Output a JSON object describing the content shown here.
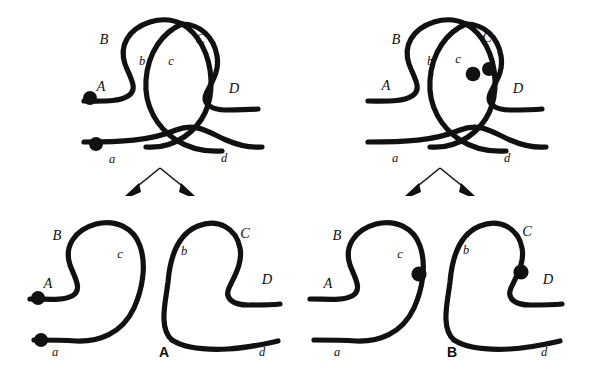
{
  "figure": {
    "kind": "recombination-intermediate-diagram",
    "background_color": "#ffffff",
    "stroke_color": "#111111",
    "panels": [
      {
        "id": "panel-A",
        "label": "A",
        "label_pos": [
          164,
          357
        ],
        "parent": {
          "id": "A-parent",
          "strand_labels": [
            {
              "text": "B",
              "x": 104,
              "y": 44,
              "case": "upper"
            },
            {
              "text": "C",
              "x": 200,
              "y": 44,
              "case": "upper"
            },
            {
              "text": "b",
              "x": 142,
              "y": 65,
              "case": "lower"
            },
            {
              "text": "c",
              "x": 171,
              "y": 65,
              "case": "lower"
            },
            {
              "text": "A",
              "x": 101,
              "y": 91,
              "case": "upper"
            },
            {
              "text": "D",
              "x": 234,
              "y": 93,
              "case": "upper"
            },
            {
              "text": "a",
              "x": 112,
              "y": 163,
              "case": "lower"
            },
            {
              "text": "d",
              "x": 224,
              "y": 162,
              "case": "lower"
            }
          ],
          "dots": [
            {
              "cx": 90,
              "cy": 98,
              "rx": 6.6,
              "ry": 7.6
            },
            {
              "cx": 96,
              "cy": 144,
              "rx": 6.4,
              "ry": 7.4
            }
          ]
        },
        "children": [
          {
            "id": "A-child-left",
            "strand_labels": [
              {
                "text": "B",
                "x": 57,
                "y": 240,
                "case": "upper"
              },
              {
                "text": "c",
                "x": 120,
                "y": 258,
                "case": "lower"
              },
              {
                "text": "A",
                "x": 48,
                "y": 288,
                "case": "upper"
              },
              {
                "text": "a",
                "x": 55,
                "y": 356,
                "case": "lower"
              }
            ],
            "dots": [
              {
                "cx": 38,
                "cy": 298,
                "rx": 6.6,
                "ry": 7.6
              },
              {
                "cx": 41,
                "cy": 340,
                "rx": 6.6,
                "ry": 7.6
              }
            ]
          },
          {
            "id": "A-child-right",
            "strand_labels": [
              {
                "text": "b",
                "x": 184,
                "y": 255,
                "case": "lower"
              },
              {
                "text": "C",
                "x": 245,
                "y": 238,
                "case": "upper"
              },
              {
                "text": "D",
                "x": 267,
                "y": 284,
                "case": "upper"
              },
              {
                "text": "d",
                "x": 262,
                "y": 356,
                "case": "lower"
              }
            ],
            "dots": []
          }
        ],
        "arrows": [
          {
            "from": [
              160,
              168
            ],
            "to": [
              131,
              192
            ]
          },
          {
            "from": [
              160,
              168
            ],
            "to": [
              189,
              192
            ]
          }
        ]
      },
      {
        "id": "panel-B",
        "label": "B",
        "label_pos": [
          452,
          357
        ],
        "parent": {
          "id": "B-parent",
          "strand_labels": [
            {
              "text": "B",
              "x": 396,
              "y": 44,
              "case": "upper"
            },
            {
              "text": "C",
              "x": 487,
              "y": 42,
              "case": "upper"
            },
            {
              "text": "b",
              "x": 430,
              "y": 65,
              "case": "lower"
            },
            {
              "text": "c",
              "x": 458,
              "y": 63,
              "case": "lower"
            },
            {
              "text": "A",
              "x": 386,
              "y": 90,
              "case": "upper"
            },
            {
              "text": "D",
              "x": 518,
              "y": 93,
              "case": "upper"
            },
            {
              "text": "a",
              "x": 395,
              "y": 162,
              "case": "lower"
            },
            {
              "text": "d",
              "x": 507,
              "y": 162,
              "case": "lower"
            }
          ],
          "dots": [
            {
              "cx": 473,
              "cy": 74,
              "rx": 6.6,
              "ry": 7.8
            },
            {
              "cx": 489,
              "cy": 69,
              "rx": 6.2,
              "ry": 7.4
            }
          ]
        },
        "children": [
          {
            "id": "B-child-left",
            "strand_labels": [
              {
                "text": "B",
                "x": 337,
                "y": 240,
                "case": "upper"
              },
              {
                "text": "c",
                "x": 400,
                "y": 258,
                "case": "lower"
              },
              {
                "text": "A",
                "x": 328,
                "y": 288,
                "case": "upper"
              },
              {
                "text": "a",
                "x": 337,
                "y": 356,
                "case": "lower"
              }
            ],
            "dots": [
              {
                "cx": 419,
                "cy": 274,
                "rx": 7.0,
                "ry": 8.0
              }
            ]
          },
          {
            "id": "B-child-right",
            "strand_labels": [
              {
                "text": "b",
                "x": 466,
                "y": 254,
                "case": "lower"
              },
              {
                "text": "C",
                "x": 527,
                "y": 236,
                "case": "upper"
              },
              {
                "text": "D",
                "x": 548,
                "y": 284,
                "case": "upper"
              },
              {
                "text": "d",
                "x": 544,
                "y": 356,
                "case": "lower"
              }
            ],
            "dots": [
              {
                "cx": 521,
                "cy": 272,
                "rx": 7.0,
                "ry": 8.0
              }
            ]
          }
        ],
        "arrows": [
          {
            "from": [
              440,
              168
            ],
            "to": [
              411,
              192
            ]
          },
          {
            "from": [
              440,
              168
            ],
            "to": [
              469,
              192
            ]
          }
        ]
      }
    ]
  }
}
